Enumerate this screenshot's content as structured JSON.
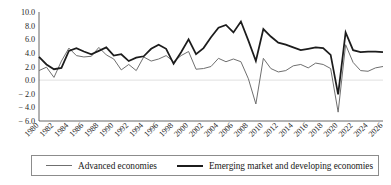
{
  "chart_data": {
    "type": "line",
    "title": "",
    "subtitle": "",
    "xlabel": "",
    "ylabel": "",
    "grid": false,
    "legend_position": "bottom",
    "ylim": [
      -6.0,
      10.0
    ],
    "yticks": [
      "10.0",
      "8.0",
      "6.0",
      "4.0",
      "2.0",
      "0.0",
      "− 2.0",
      "− 4.0",
      "− 6.0"
    ],
    "ytick_values": [
      10.0,
      8.0,
      6.0,
      4.0,
      2.0,
      0.0,
      -2.0,
      -4.0,
      -6.0
    ],
    "xlim": [
      1980,
      2026
    ],
    "xticks": [
      "1980",
      "1982",
      "1984",
      "1986",
      "1988",
      "1990",
      "1992",
      "1994",
      "1996",
      "1998",
      "2000",
      "2002",
      "2004",
      "2006",
      "2008",
      "2010",
      "2012",
      "2014",
      "2016",
      "2018",
      "2020",
      "2022",
      "2024",
      "2026"
    ],
    "x": [
      1980,
      1981,
      1982,
      1983,
      1984,
      1985,
      1986,
      1987,
      1988,
      1989,
      1990,
      1991,
      1992,
      1993,
      1994,
      1995,
      1996,
      1997,
      1998,
      1999,
      2000,
      2001,
      2002,
      2003,
      2004,
      2005,
      2006,
      2007,
      2008,
      2009,
      2010,
      2011,
      2012,
      2013,
      2014,
      2015,
      2016,
      2017,
      2018,
      2019,
      2020,
      2021,
      2022,
      2023,
      2024,
      2025,
      2026
    ],
    "series": [
      {
        "name": "Advanced economies",
        "color": "#6f6f6f",
        "line_width": 1.0,
        "values": [
          1.4,
          1.9,
          0.4,
          2.8,
          4.7,
          3.6,
          3.4,
          3.5,
          4.8,
          3.7,
          3.1,
          1.5,
          2.3,
          1.4,
          3.4,
          2.8,
          3.1,
          3.6,
          2.7,
          3.6,
          4.2,
          1.6,
          1.7,
          2.0,
          3.2,
          2.7,
          3.1,
          2.7,
          0.2,
          -3.5,
          3.2,
          1.7,
          1.2,
          1.4,
          2.1,
          2.3,
          1.8,
          2.5,
          2.3,
          1.7,
          -4.7,
          5.2,
          2.6,
          1.4,
          1.3,
          1.8,
          2.0
        ],
        "y_min": -4.7,
        "y_max": 5.2
      },
      {
        "name": "Emerging market and developing economies",
        "color": "#1c1c1c",
        "line_width": 1.75,
        "values": [
          3.4,
          2.3,
          1.6,
          1.8,
          4.3,
          4.7,
          4.2,
          3.8,
          4.3,
          4.8,
          3.6,
          3.8,
          2.8,
          3.3,
          3.5,
          4.6,
          5.2,
          4.6,
          2.4,
          4.1,
          6.0,
          3.8,
          4.7,
          6.3,
          7.7,
          8.1,
          7.0,
          8.6,
          5.8,
          2.8,
          7.5,
          6.4,
          5.5,
          5.2,
          4.8,
          4.4,
          4.6,
          4.8,
          4.7,
          3.7,
          -2.1,
          7.0,
          4.4,
          4.1,
          4.2,
          4.2,
          4.1
        ],
        "y_min": -2.1,
        "y_max": 8.6
      }
    ]
  },
  "legend": {
    "items": [
      {
        "label": "Advanced economies"
      },
      {
        "label": "Emerging market and developing economies"
      }
    ]
  }
}
